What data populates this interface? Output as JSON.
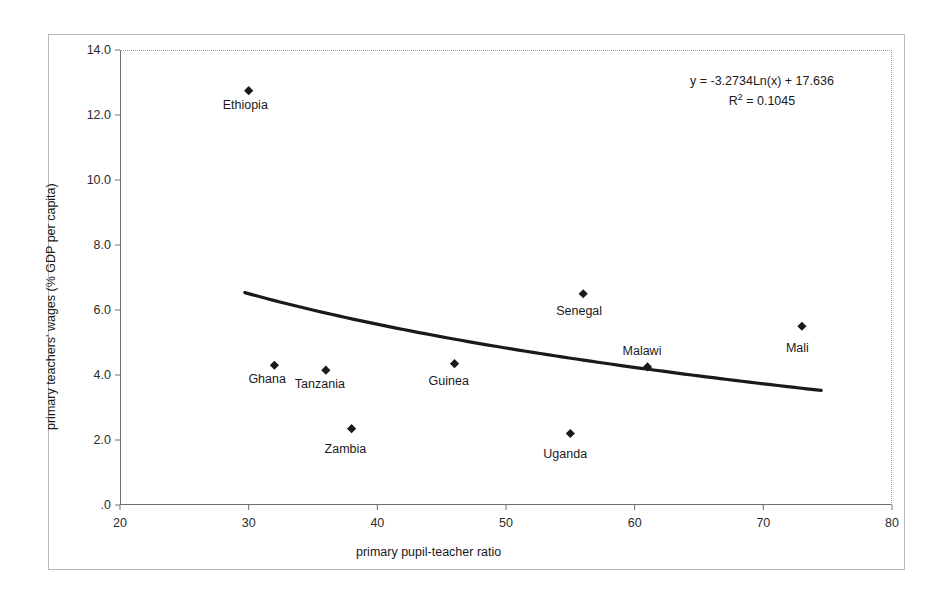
{
  "chart_data": {
    "type": "scatter",
    "title": "",
    "xlabel": "primary pupil-teacher ratio",
    "ylabel": "primary teachers' wages (% GDP per capita)",
    "xlim": [
      20,
      80
    ],
    "ylim": [
      0,
      14
    ],
    "xticks": [
      "20",
      "30",
      "40",
      "50",
      "60",
      "70",
      "80"
    ],
    "yticks": [
      ".0",
      "2.0",
      "4.0",
      "6.0",
      "8.0",
      "10.0",
      "12.0",
      "14.0"
    ],
    "xtick_values": [
      20,
      30,
      40,
      50,
      60,
      70,
      80
    ],
    "ytick_values": [
      0,
      2,
      4,
      6,
      8,
      10,
      12,
      14
    ],
    "grid": false,
    "legend": "none",
    "marker": "diamond",
    "marker_color": "#1a1a1a",
    "trendline_color": "#1a1a1a",
    "points": [
      {
        "name": "Ethiopia",
        "x": 30,
        "y": 12.75,
        "label_dx": -26,
        "label_dy": 14
      },
      {
        "name": "Ghana",
        "x": 32,
        "y": 4.3,
        "label_dx": -26,
        "label_dy": 14
      },
      {
        "name": "Tanzania",
        "x": 36,
        "y": 4.15,
        "label_dx": -31,
        "label_dy": 14
      },
      {
        "name": "Zambia",
        "x": 38,
        "y": 2.35,
        "label_dx": -27,
        "label_dy": 20
      },
      {
        "name": "Guinea",
        "x": 46,
        "y": 4.35,
        "label_dx": -26,
        "label_dy": 17
      },
      {
        "name": "Uganda",
        "x": 55,
        "y": 2.2,
        "label_dx": -27,
        "label_dy": 20
      },
      {
        "name": "Senegal",
        "x": 56,
        "y": 6.5,
        "label_dx": -27,
        "label_dy": 17
      },
      {
        "name": "Malawi",
        "x": 61,
        "y": 4.25,
        "label_dx": -25,
        "label_dy": -16
      },
      {
        "name": "Mali",
        "x": 73,
        "y": 5.5,
        "label_dx": -16,
        "label_dy": 22
      }
    ],
    "trendline": {
      "equation": "y = -3.2734Ln(x) + 17.636",
      "r_squared_label": "R",
      "r_squared_sup": "2",
      "r_squared_value": "= 0.1045",
      "r_squared_text": "R² = 0.1045",
      "coef_a": -3.2734,
      "coef_b": 17.636,
      "r2": 0.1045,
      "x_start": 29.7,
      "x_end": 74.5
    }
  }
}
